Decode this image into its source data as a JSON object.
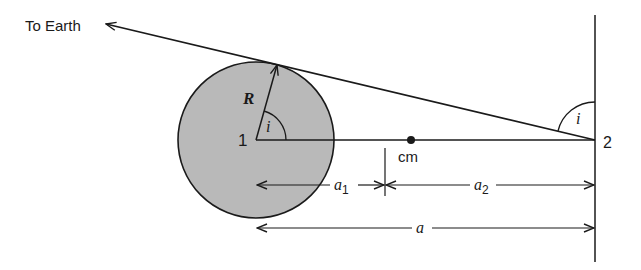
{
  "diagram": {
    "colors": {
      "background": "#ffffff",
      "stroke": "#1a1a1a",
      "star_fill": "#b9b9b9"
    },
    "labels": {
      "to_earth": "To Earth",
      "radius": "R",
      "angle_at_star": "i",
      "angle_at_companion": "i",
      "star_1": "1",
      "star_2": "2",
      "center_of_mass": "cm",
      "a1_main": "a",
      "a1_sub": "1",
      "a2_main": "a",
      "a2_sub": "2",
      "a_total": "a"
    },
    "elements": [
      {
        "name": "star-1",
        "shape": "circle",
        "center": [
          256,
          140
        ],
        "radius": 78
      },
      {
        "name": "line-of-sight",
        "from": [
          595,
          140
        ],
        "to": [
          105,
          24
        ],
        "arrow": "to-earth"
      },
      {
        "name": "radius-R",
        "from": [
          256,
          140
        ],
        "to": [
          277,
          64
        ],
        "arrow": "end"
      },
      {
        "name": "orbital-axis",
        "from": [
          256,
          140
        ],
        "to": [
          595,
          140
        ]
      },
      {
        "name": "companion-vertical",
        "from": [
          595,
          15
        ],
        "to": [
          595,
          262
        ]
      },
      {
        "name": "cm-point",
        "at": [
          411,
          140
        ]
      },
      {
        "name": "a1-dimension",
        "from": [
          256,
          185
        ],
        "to": [
          385,
          185
        ]
      },
      {
        "name": "a2-dimension",
        "from": [
          385,
          185
        ],
        "to": [
          595,
          185
        ]
      },
      {
        "name": "a-dimension",
        "from": [
          256,
          228
        ],
        "to": [
          595,
          228
        ]
      }
    ]
  }
}
